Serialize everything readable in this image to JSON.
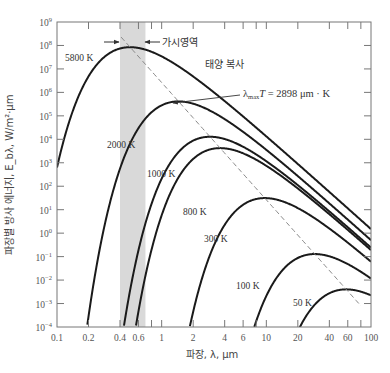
{
  "chart_data": {
    "type": "line",
    "title": "",
    "xlabel": "파장, λ, μm",
    "ylabel": "파장별 방사 에너지, E_bλ, W/m²·μm",
    "xscale": "log",
    "yscale": "log",
    "xlim": [
      0.1,
      100
    ],
    "ylim": [
      0.0001,
      1000000000
    ],
    "x_ticks": [
      {
        "value": 0.1,
        "label": "0.1"
      },
      {
        "value": 0.2,
        "label": "0.2"
      },
      {
        "value": 0.4,
        "label": "0.4"
      },
      {
        "value": 0.6,
        "label": "0.6"
      },
      {
        "value": 1,
        "label": "1"
      },
      {
        "value": 2,
        "label": "2"
      },
      {
        "value": 4,
        "label": "4"
      },
      {
        "value": 6,
        "label": "6"
      },
      {
        "value": 10,
        "label": "10"
      },
      {
        "value": 20,
        "label": "20"
      },
      {
        "value": 40,
        "label": "40"
      },
      {
        "value": 60,
        "label": "60"
      },
      {
        "value": 100,
        "label": "100"
      }
    ],
    "x_minor_ticks": [
      0.8,
      8,
      80
    ],
    "y_ticks": [
      {
        "exp": 9,
        "label": "10",
        "sup": "9"
      },
      {
        "exp": 8,
        "label": "10",
        "sup": "8"
      },
      {
        "exp": 7,
        "label": "10",
        "sup": "7"
      },
      {
        "exp": 6,
        "label": "10",
        "sup": "6"
      },
      {
        "exp": 5,
        "label": "10",
        "sup": "5"
      },
      {
        "exp": 4,
        "label": "10",
        "sup": "4"
      },
      {
        "exp": 3,
        "label": "10",
        "sup": "3"
      },
      {
        "exp": 2,
        "label": "10",
        "sup": "2"
      },
      {
        "exp": 1,
        "label": "10",
        "sup": "1"
      },
      {
        "exp": 0,
        "label": "10",
        "sup": "0"
      },
      {
        "exp": -1,
        "label": "10",
        "sup": "−1"
      },
      {
        "exp": -2,
        "label": "10",
        "sup": "−2"
      },
      {
        "exp": -3,
        "label": "10",
        "sup": "−3"
      },
      {
        "exp": -4,
        "label": "10",
        "sup": "−4"
      }
    ],
    "grid": false,
    "planck_constants": {
      "C1": 374200000,
      "C2": 14390
    },
    "series": [
      {
        "name": "5800 K",
        "temperature": 5800,
        "peak_lambda": 0.5,
        "peak_value": 84600000,
        "label": "5800 K",
        "label_pos": [
          65,
          61
        ]
      },
      {
        "name": "2000 K",
        "temperature": 2000,
        "peak_lambda": 1.45,
        "peak_value": 352000,
        "label": "2000 K",
        "label_pos": [
          107,
          148
        ]
      },
      {
        "name": "1000 K",
        "temperature": 1000,
        "peak_lambda": 2.9,
        "peak_value": 12900,
        "label": "1000 K",
        "label_pos": [
          147,
          177
        ]
      },
      {
        "name": "800 K",
        "temperature": 800,
        "peak_lambda": 3.62,
        "peak_value": 4220,
        "label": "800 K",
        "label_pos": [
          183,
          215
        ]
      },
      {
        "name": "300 K",
        "temperature": 300,
        "peak_lambda": 9.66,
        "peak_value": 31.2,
        "label": "300 K",
        "label_pos": [
          204,
          242
        ]
      },
      {
        "name": "100 K",
        "temperature": 100,
        "peak_lambda": 29,
        "peak_value": 0.128,
        "label": "100 K",
        "label_pos": [
          236,
          289
        ]
      },
      {
        "name": "50 K",
        "temperature": 50,
        "peak_lambda": 58,
        "peak_value": 0.004,
        "label": "50 K",
        "label_pos": [
          293,
          306
        ]
      }
    ],
    "annotations": [
      {
        "type": "shaded_band",
        "x_range": [
          0.4,
          0.7
        ],
        "label": "가시영역",
        "color": "#d9d9d9"
      },
      {
        "type": "text",
        "text": "태양 복사"
      },
      {
        "type": "dashed_line",
        "formula": "λmax T = 2898 μm·K",
        "label_main": "λ",
        "label_sub": "max",
        "label_T": "T",
        "label_rest": " = 2898 μm · K"
      }
    ]
  },
  "labels": {
    "visible_region": "가시영역",
    "solar_radiation": "태양 복사",
    "wien_lambda": "λ",
    "wien_sub": "max",
    "wien_T": "T",
    "wien_rest": " = 2898 μm · K",
    "xlabel": "파장, λ, μm",
    "ylabel": "파장별 방사 에너지, E_bλ, W/m²·μm"
  },
  "colors": {
    "curve": "#1a1a1a",
    "axis": "#666666",
    "band": "#d9d9d9",
    "dashed": "#888888",
    "text": "#444444"
  }
}
